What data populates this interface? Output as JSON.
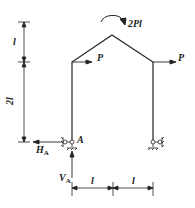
{
  "diagram": {
    "labels": {
      "moment": "2Pl",
      "load_left": "P",
      "load_right": "P",
      "support_left": "A",
      "reaction_h": "H",
      "reaction_h_sub": "A",
      "reaction_v": "V",
      "reaction_v_sub": "A",
      "dim_top": "l",
      "dim_mid": "2l",
      "dim_bottom_left": "l",
      "dim_bottom_right": "l"
    },
    "colors": {
      "stroke": "#222222",
      "background": "#ffffff"
    }
  }
}
